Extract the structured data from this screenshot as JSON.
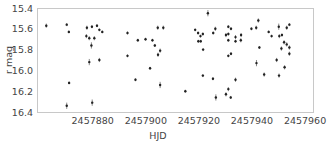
{
  "chart_data": {
    "type": "scatter",
    "title": "",
    "xlabel": "HJD",
    "ylabel": "r mag",
    "xlim": [
      2457859,
      2457963
    ],
    "ylim": [
      16.4,
      15.4
    ],
    "y_inverted": true,
    "grid": false,
    "legend": null,
    "x_ticks": [
      2457880,
      2457900,
      2457920,
      2457940,
      2457960
    ],
    "x_tick_labels": [
      "2457880",
      "2457900",
      "2457920",
      "2457940",
      "2457960"
    ],
    "y_ticks": [
      15.4,
      15.6,
      15.8,
      16.0,
      16.2,
      16.4
    ],
    "y_tick_labels": [
      "15.4",
      "15.6",
      "15.8",
      "16.0",
      "16.2",
      "16.4"
    ],
    "marker_color": "#222222",
    "series": [
      {
        "name": "r",
        "points": [
          {
            "x": 2457862.5,
            "y": 15.57,
            "err": 0.02
          },
          {
            "x": 2457870.2,
            "y": 15.56,
            "err": 0.01
          },
          {
            "x": 2457871.0,
            "y": 15.63,
            "err": 0.01
          },
          {
            "x": 2457871.1,
            "y": 16.12,
            "err": 0.01
          },
          {
            "x": 2457870.2,
            "y": 16.34,
            "err": 0.03
          },
          {
            "x": 2457877.8,
            "y": 15.59,
            "err": 0.02
          },
          {
            "x": 2457879.7,
            "y": 15.58,
            "err": 0.01
          },
          {
            "x": 2457881.6,
            "y": 15.57,
            "err": 0.01
          },
          {
            "x": 2457882.5,
            "y": 15.61,
            "err": 0.01
          },
          {
            "x": 2457883.6,
            "y": 15.63,
            "err": 0.01
          },
          {
            "x": 2457877.6,
            "y": 15.67,
            "err": 0.02
          },
          {
            "x": 2457878.7,
            "y": 15.69,
            "err": 0.02
          },
          {
            "x": 2457880.6,
            "y": 15.69,
            "err": 0.02
          },
          {
            "x": 2457879.5,
            "y": 15.76,
            "err": 0.03
          },
          {
            "x": 2457878.7,
            "y": 15.92,
            "err": 0.03
          },
          {
            "x": 2457882.5,
            "y": 15.9,
            "err": 0.02
          },
          {
            "x": 2457879.8,
            "y": 16.31,
            "err": 0.03
          },
          {
            "x": 2457893.1,
            "y": 15.64,
            "err": 0.01
          },
          {
            "x": 2457897.0,
            "y": 15.71,
            "err": 0.01
          },
          {
            "x": 2457899.9,
            "y": 15.7,
            "err": 0.01
          },
          {
            "x": 2457902.5,
            "y": 15.71,
            "err": 0.01
          },
          {
            "x": 2457903.4,
            "y": 15.76,
            "err": 0.01
          },
          {
            "x": 2457904.5,
            "y": 15.59,
            "err": 0.02
          },
          {
            "x": 2457906.6,
            "y": 15.59,
            "err": 0.02
          },
          {
            "x": 2457905.4,
            "y": 15.81,
            "err": 0.02
          },
          {
            "x": 2457904.6,
            "y": 15.85,
            "err": 0.02
          },
          {
            "x": 2457893.1,
            "y": 15.86,
            "err": 0.01
          },
          {
            "x": 2457901.6,
            "y": 15.98,
            "err": 0.01
          },
          {
            "x": 2457896.1,
            "y": 16.09,
            "err": 0.01
          },
          {
            "x": 2457905.4,
            "y": 16.14,
            "err": 0.03
          },
          {
            "x": 2457914.9,
            "y": 16.2,
            "err": 0.01
          },
          {
            "x": 2457918.6,
            "y": 15.61,
            "err": 0.01
          },
          {
            "x": 2457919.7,
            "y": 15.64,
            "err": 0.01
          },
          {
            "x": 2457920.6,
            "y": 15.67,
            "err": 0.01
          },
          {
            "x": 2457921.5,
            "y": 15.65,
            "err": 0.01
          },
          {
            "x": 2457919.8,
            "y": 15.72,
            "err": 0.01
          },
          {
            "x": 2457920.7,
            "y": 15.72,
            "err": 0.01
          },
          {
            "x": 2457921.6,
            "y": 15.8,
            "err": 0.01
          },
          {
            "x": 2457923.4,
            "y": 15.45,
            "err": 0.03
          },
          {
            "x": 2457925.4,
            "y": 15.64,
            "err": 0.01
          },
          {
            "x": 2457926.2,
            "y": 15.6,
            "err": 0.02
          },
          {
            "x": 2457930.2,
            "y": 15.66,
            "err": 0.02
          },
          {
            "x": 2457921.5,
            "y": 16.05,
            "err": 0.01
          },
          {
            "x": 2457925.3,
            "y": 16.08,
            "err": 0.01
          },
          {
            "x": 2457926.4,
            "y": 16.26,
            "err": 0.03
          },
          {
            "x": 2457930.2,
            "y": 16.23,
            "err": 0.02
          },
          {
            "x": 2457931.1,
            "y": 15.58,
            "err": 0.01
          },
          {
            "x": 2457932.1,
            "y": 15.6,
            "err": 0.01
          },
          {
            "x": 2457931.1,
            "y": 15.65,
            "err": 0.01
          },
          {
            "x": 2457931.1,
            "y": 15.71,
            "err": 0.01
          },
          {
            "x": 2457933.8,
            "y": 15.68,
            "err": 0.02
          },
          {
            "x": 2457933.8,
            "y": 15.72,
            "err": 0.01
          },
          {
            "x": 2457935.9,
            "y": 15.66,
            "err": 0.02
          },
          {
            "x": 2457935.8,
            "y": 15.71,
            "err": 0.02
          },
          {
            "x": 2457931.1,
            "y": 15.86,
            "err": 0.01
          },
          {
            "x": 2457932.1,
            "y": 15.84,
            "err": 0.01
          },
          {
            "x": 2457933.8,
            "y": 16.09,
            "err": 0.02
          },
          {
            "x": 2457931.1,
            "y": 16.18,
            "err": 0.02
          },
          {
            "x": 2457932.0,
            "y": 16.26,
            "err": 0.01
          },
          {
            "x": 2457939.8,
            "y": 15.6,
            "err": 0.01
          },
          {
            "x": 2457941.6,
            "y": 15.59,
            "err": 0.02
          },
          {
            "x": 2457942.4,
            "y": 15.52,
            "err": 0.02
          },
          {
            "x": 2457942.8,
            "y": 15.78,
            "err": 0.01
          },
          {
            "x": 2457941.7,
            "y": 15.93,
            "err": 0.03
          },
          {
            "x": 2457944.6,
            "y": 16.04,
            "err": 0.02
          },
          {
            "x": 2457946.3,
            "y": 15.63,
            "err": 0.01
          },
          {
            "x": 2457947.4,
            "y": 15.67,
            "err": 0.01
          },
          {
            "x": 2457950.1,
            "y": 15.58,
            "err": 0.03
          },
          {
            "x": 2457950.3,
            "y": 15.67,
            "err": 0.02
          },
          {
            "x": 2457951.3,
            "y": 15.66,
            "err": 0.01
          },
          {
            "x": 2457953.1,
            "y": 15.59,
            "err": 0.02
          },
          {
            "x": 2457954.1,
            "y": 15.56,
            "err": 0.01
          },
          {
            "x": 2457952.1,
            "y": 15.73,
            "err": 0.02
          },
          {
            "x": 2457953.1,
            "y": 15.75,
            "err": 0.02
          },
          {
            "x": 2457954.1,
            "y": 15.78,
            "err": 0.02
          },
          {
            "x": 2457951.1,
            "y": 15.79,
            "err": 0.02
          },
          {
            "x": 2457954.1,
            "y": 15.84,
            "err": 0.02
          },
          {
            "x": 2457949.3,
            "y": 15.9,
            "err": 0.02
          },
          {
            "x": 2457952.3,
            "y": 15.97,
            "err": 0.02
          },
          {
            "x": 2457950.2,
            "y": 16.05,
            "err": 0.02
          }
        ]
      }
    ]
  },
  "layout": {
    "plot_left": 37,
    "plot_top": 8,
    "plot_right": 313,
    "plot_bottom": 112
  }
}
